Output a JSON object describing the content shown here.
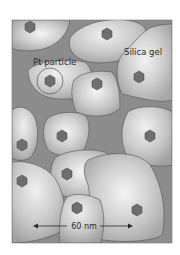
{
  "diagram": {
    "labels": {
      "pt_particle": "Pt particle",
      "silica_gel": "Silica gel",
      "scale_bar": "60 nm"
    },
    "colors": {
      "background": "#ffffff",
      "pore_space": "#8a8a8a",
      "grain_fill": "#c4c4c4",
      "grain_highlight": "#f2f2f2",
      "grain_outline": "#555555",
      "particle_fill": "#6e6e6e",
      "particle_dark": "#3e3e3e",
      "text": "#2a2a2a"
    },
    "particles": [
      {
        "x": 30,
        "y": 27
      },
      {
        "x": 107,
        "y": 34
      },
      {
        "x": 139,
        "y": 77
      },
      {
        "x": 50,
        "y": 81
      },
      {
        "x": 97,
        "y": 84
      },
      {
        "x": 22,
        "y": 145
      },
      {
        "x": 62,
        "y": 136
      },
      {
        "x": 150,
        "y": 136
      },
      {
        "x": 67,
        "y": 174
      },
      {
        "x": 22,
        "y": 181
      },
      {
        "x": 77,
        "y": 208
      },
      {
        "x": 137,
        "y": 210
      }
    ]
  }
}
